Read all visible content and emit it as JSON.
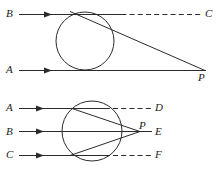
{
  "figure": {
    "background_color": "#ffffff",
    "stroke_color": "#2b2b2b",
    "label_color": "#1a1a1a",
    "diagrams": [
      {
        "id": "upper",
        "description": "A circle with two parallel incoming rays B and A; ray B refracts through the circle and meets ray A at P. A dashed line continues ray B to C.",
        "circle": {
          "cx": 85,
          "cy": 41,
          "r": 29
        },
        "rays": [
          {
            "name": "B",
            "y": 14,
            "label": "B",
            "arrow_x": 47
          },
          {
            "name": "A",
            "y": 70,
            "label": "A",
            "arrow_x": 47
          }
        ],
        "dashed_extensions": [
          {
            "name": "BC",
            "label": "C",
            "y": 14
          }
        ],
        "intersection_point": {
          "label": "P",
          "x": 205,
          "y": 70
        },
        "labels": [
          {
            "text": "B",
            "x": 6,
            "y": 8
          },
          {
            "text": "C",
            "x": 205,
            "y": 8
          },
          {
            "text": "A",
            "x": 6,
            "y": 64
          },
          {
            "text": "P",
            "x": 198,
            "y": 72
          }
        ]
      },
      {
        "id": "lower",
        "description": "A circle with three parallel incoming rays A, B and C all converging at point P to the right of the circle. Dashed lines continue rays A and C to D and F; ray B continues to E.",
        "circle": {
          "cx": 92,
          "cy": 131,
          "r": 30
        },
        "rays": [
          {
            "name": "A",
            "y": 108,
            "label": "A",
            "arrow_x": 39
          },
          {
            "name": "B",
            "y": 132,
            "label": "B",
            "arrow_x": 39
          },
          {
            "name": "C",
            "y": 155,
            "label": "C",
            "arrow_x": 39
          }
        ],
        "dashed_extensions": [
          {
            "name": "AD",
            "label": "D",
            "y": 108
          },
          {
            "name": "BE",
            "label": "E",
            "y": 132
          },
          {
            "name": "CF",
            "label": "F",
            "y": 155
          }
        ],
        "intersection_point": {
          "label": "P",
          "x": 140,
          "y": 132
        },
        "labels": [
          {
            "text": "A",
            "x": 6,
            "y": 102
          },
          {
            "text": "B",
            "x": 6,
            "y": 126
          },
          {
            "text": "C",
            "x": 6,
            "y": 149
          },
          {
            "text": "D",
            "x": 155,
            "y": 102
          },
          {
            "text": "P",
            "x": 139,
            "y": 121
          },
          {
            "text": "E",
            "x": 155,
            "y": 126
          },
          {
            "text": "F",
            "x": 155,
            "y": 149
          }
        ]
      }
    ]
  }
}
